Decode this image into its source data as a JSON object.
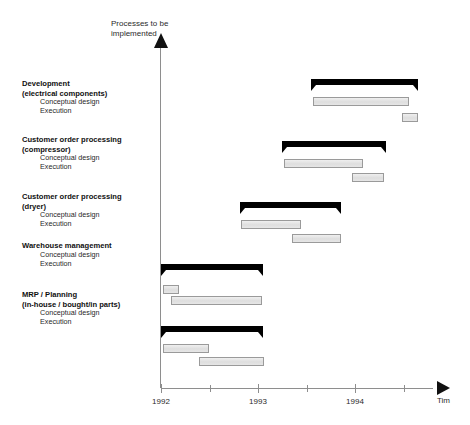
{
  "axes": {
    "y_title": "Processes to be implemented",
    "x_title": "Tim",
    "ticks": [
      {
        "label": "1992",
        "x": 161,
        "major": true
      },
      {
        "label": "",
        "x": 210,
        "major": false
      },
      {
        "label": "1993",
        "x": 258,
        "major": true
      },
      {
        "label": "",
        "x": 307,
        "major": false
      },
      {
        "label": "1994",
        "x": 355,
        "major": true
      },
      {
        "label": "",
        "x": 404,
        "major": false
      }
    ]
  },
  "labels": {
    "conceptual_design": "Conceptual design",
    "execution": "Execution"
  },
  "chart_data": {
    "type": "bar",
    "title": "Processes to be implemented",
    "xlabel": "Tim",
    "ylabel": "Processes to be implemented",
    "x_axis_kind": "time",
    "xlim": [
      "1992",
      "1994.5"
    ],
    "tick_labels": [
      "1992",
      "1993",
      "1994"
    ],
    "grid": false,
    "legend": "none",
    "groups": [
      {
        "name": "Development (electrical components)",
        "name_line1": "Development",
        "name_line2": "(electrical components)",
        "summary": {
          "start": 1993.55,
          "end": 1994.65
        },
        "tasks": [
          {
            "label": "Conceptual design",
            "start": 1993.57,
            "end": 1994.55
          },
          {
            "label": "Execution",
            "start": 1994.48,
            "end": 1994.63
          }
        ]
      },
      {
        "name": "Customer order processing (compressor)",
        "name_line1": "Customer order processing",
        "name_line2": "(compressor)",
        "summary": {
          "start": 1993.25,
          "end": 1994.31
        },
        "tasks": [
          {
            "label": "Conceptual design",
            "start": 1993.27,
            "end": 1994.07
          },
          {
            "label": "Execution",
            "start": 1993.97,
            "end": 1994.29
          }
        ]
      },
      {
        "name": "Customer order processing (dryer)",
        "name_line1": "Customer order processing",
        "name_line2": "(dryer)",
        "summary": {
          "start": 1992.81,
          "end": 1993.85
        },
        "tasks": [
          {
            "label": "Conceptual design",
            "start": 1992.82,
            "end": 1993.43
          },
          {
            "label": "Execution",
            "start": 1993.35,
            "end": 1993.84
          }
        ]
      },
      {
        "name": "Warehouse management",
        "name_line1": "Warehouse management",
        "name_line2": "",
        "summary": {
          "start": 1992.0,
          "end": 1993.05
        },
        "tasks": [
          {
            "label": "Conceptual design",
            "start": 1992.02,
            "end": 1992.18
          },
          {
            "label": "Execution",
            "start": 1992.1,
            "end": 1993.04
          }
        ]
      },
      {
        "name": "MRP / Planning (in-house / bought/in parts)",
        "name_line1": "MRP / Planning",
        "name_line2": "(in-house / bought/in parts)",
        "summary": {
          "start": 1992.0,
          "end": 1993.05
        },
        "tasks": [
          {
            "label": "Conceptual design",
            "start": 1992.02,
            "end": 1992.48
          },
          {
            "label": "Execution",
            "start": 1992.39,
            "end": 1993.05
          }
        ]
      }
    ]
  }
}
